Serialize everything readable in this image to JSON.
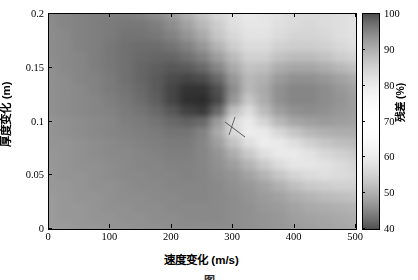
{
  "figure": {
    "caption": "图"
  },
  "axes": {
    "x": {
      "title": "速度变化 (m/s)",
      "ticks": [
        0,
        100,
        200,
        300,
        400,
        500
      ],
      "tick_labels": [
        "0",
        "100",
        "200",
        "300",
        "400",
        "500"
      ],
      "min": 0,
      "max": 500
    },
    "y": {
      "title": "厚度变化 (m)",
      "ticks": [
        0,
        0.05,
        0.1,
        0.15,
        0.2
      ],
      "tick_labels": [
        "0",
        "0.05",
        "0.1",
        "0.15",
        "0.2"
      ],
      "min": 0,
      "max": 0.2
    }
  },
  "colorbar": {
    "title": "残差 (%)",
    "ticks": [
      40,
      50,
      60,
      70,
      80,
      90,
      100
    ],
    "tick_labels": [
      "40",
      "50",
      "60",
      "70",
      "80",
      "90",
      "100"
    ],
    "min": 40,
    "max": 100,
    "colormap": "gray-inverted"
  },
  "marker": {
    "type": "crosshair-line",
    "x": 292,
    "y": 0.112,
    "color": "#555555"
  },
  "chart_data": {
    "type": "heatmap",
    "title": "",
    "xlabel": "速度变化 (m/s)",
    "ylabel": "厚度变化 (m)",
    "zlabel": "残差 (%)",
    "xlim": [
      0,
      500
    ],
    "ylim": [
      0,
      0.2
    ],
    "zlim": [
      40,
      100
    ],
    "grid": false,
    "legend": "colorbar-right",
    "colormap": "gray",
    "minimum": {
      "x": 280,
      "y": 0.105,
      "z": 41
    },
    "x_samples": [
      0,
      25,
      50,
      75,
      100,
      125,
      150,
      175,
      200,
      225,
      250,
      275,
      300,
      325,
      350,
      375,
      400,
      425,
      450,
      475,
      500
    ],
    "y_samples": [
      0,
      0.01,
      0.02,
      0.03,
      0.04,
      0.05,
      0.06,
      0.07,
      0.08,
      0.09,
      0.1,
      0.11,
      0.12,
      0.13,
      0.14,
      0.15,
      0.16,
      0.17,
      0.18,
      0.19,
      0.2
    ],
    "z_rows": [
      [
        72,
        72,
        71,
        71,
        70,
        70,
        69,
        69,
        68,
        68,
        68,
        68,
        68,
        69,
        70,
        71,
        72,
        73,
        74,
        75,
        76
      ],
      [
        72,
        71,
        71,
        70,
        70,
        69,
        69,
        68,
        68,
        67,
        67,
        67,
        68,
        69,
        70,
        71,
        73,
        74,
        75,
        76,
        77
      ],
      [
        72,
        71,
        71,
        70,
        69,
        69,
        68,
        68,
        67,
        67,
        67,
        67,
        68,
        69,
        71,
        72,
        74,
        76,
        77,
        78,
        79
      ],
      [
        72,
        71,
        70,
        70,
        69,
        68,
        68,
        67,
        67,
        66,
        66,
        67,
        68,
        70,
        72,
        74,
        77,
        79,
        81,
        82,
        83
      ],
      [
        71,
        71,
        70,
        69,
        69,
        68,
        67,
        67,
        66,
        66,
        66,
        67,
        69,
        71,
        74,
        78,
        82,
        85,
        86,
        87,
        87
      ],
      [
        71,
        70,
        70,
        69,
        68,
        67,
        67,
        66,
        66,
        65,
        66,
        68,
        70,
        74,
        79,
        84,
        88,
        90,
        91,
        90,
        89
      ],
      [
        71,
        70,
        69,
        69,
        68,
        67,
        66,
        66,
        65,
        65,
        66,
        69,
        73,
        79,
        85,
        90,
        93,
        93,
        92,
        90,
        88
      ],
      [
        71,
        70,
        69,
        68,
        67,
        67,
        66,
        65,
        64,
        64,
        66,
        70,
        77,
        85,
        91,
        94,
        94,
        92,
        89,
        87,
        85
      ],
      [
        70,
        70,
        69,
        68,
        67,
        66,
        65,
        64,
        63,
        63,
        66,
        73,
        83,
        91,
        95,
        94,
        91,
        87,
        84,
        82,
        81
      ],
      [
        70,
        69,
        68,
        67,
        66,
        65,
        64,
        63,
        61,
        61,
        65,
        76,
        89,
        95,
        94,
        89,
        84,
        80,
        78,
        77,
        77
      ],
      [
        70,
        69,
        68,
        67,
        66,
        64,
        63,
        61,
        58,
        56,
        58,
        72,
        90,
        94,
        88,
        80,
        75,
        73,
        72,
        73,
        74
      ],
      [
        69,
        68,
        67,
        66,
        65,
        63,
        61,
        58,
        53,
        47,
        45,
        58,
        82,
        90,
        81,
        73,
        69,
        68,
        69,
        71,
        73
      ],
      [
        69,
        68,
        67,
        66,
        64,
        62,
        59,
        55,
        48,
        42,
        41,
        49,
        71,
        84,
        77,
        69,
        66,
        66,
        68,
        70,
        73
      ],
      [
        69,
        68,
        67,
        65,
        63,
        61,
        58,
        54,
        48,
        43,
        43,
        51,
        68,
        80,
        76,
        69,
        66,
        66,
        68,
        71,
        74
      ],
      [
        69,
        68,
        66,
        65,
        63,
        60,
        57,
        54,
        50,
        48,
        50,
        58,
        71,
        80,
        78,
        72,
        69,
        69,
        71,
        74,
        77
      ],
      [
        69,
        67,
        66,
        64,
        62,
        60,
        57,
        55,
        53,
        54,
        58,
        66,
        76,
        83,
        82,
        77,
        75,
        75,
        77,
        80,
        83
      ],
      [
        68,
        67,
        66,
        64,
        62,
        60,
        58,
        57,
        57,
        60,
        65,
        73,
        81,
        87,
        87,
        83,
        81,
        81,
        83,
        86,
        88
      ],
      [
        68,
        67,
        65,
        64,
        62,
        60,
        59,
        59,
        61,
        65,
        71,
        79,
        86,
        90,
        90,
        87,
        86,
        86,
        87,
        89,
        91
      ],
      [
        68,
        67,
        65,
        64,
        63,
        61,
        61,
        62,
        65,
        70,
        76,
        84,
        89,
        92,
        92,
        90,
        88,
        88,
        89,
        91,
        92
      ],
      [
        68,
        66,
        65,
        64,
        63,
        62,
        62,
        64,
        68,
        74,
        80,
        86,
        91,
        93,
        93,
        91,
        90,
        89,
        90,
        91,
        92
      ],
      [
        67,
        66,
        65,
        64,
        64,
        64,
        65,
        68,
        72,
        78,
        84,
        89,
        92,
        94,
        93,
        92,
        90,
        90,
        90,
        91,
        92
      ]
    ]
  }
}
